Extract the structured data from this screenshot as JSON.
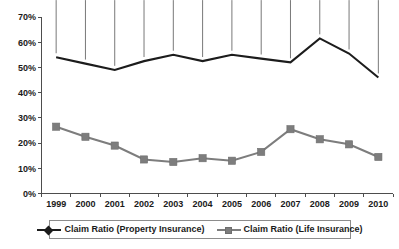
{
  "chart_data": {
    "type": "line",
    "title": "",
    "subtitle": "",
    "xlabel": "",
    "ylabel": "",
    "categories": [
      "1999",
      "2000",
      "2001",
      "2002",
      "2003",
      "2004",
      "2005",
      "2006",
      "2007",
      "2008",
      "2009",
      "2010"
    ],
    "ylim": [
      0,
      70
    ],
    "y_tick_labels": [
      "0%",
      "10%",
      "20%",
      "30%",
      "40%",
      "50%",
      "60%",
      "70%"
    ],
    "y_tick_values": [
      0,
      10,
      20,
      30,
      40,
      50,
      60,
      70
    ],
    "grid": false,
    "legend_position": "bottom",
    "series": [
      {
        "name": "Claim Ratio (Property Insurance)",
        "color": "#1c1c1c",
        "marker": "diamond",
        "values": [
          54,
          51.5,
          49,
          52.5,
          55,
          52.5,
          55,
          53.5,
          52,
          61.5,
          55.5,
          46
        ]
      },
      {
        "name": "Claim Ratio (Life Insurance)",
        "color": "#7d7d7d",
        "marker": "square",
        "values": [
          26.5,
          22.5,
          19,
          13.5,
          12.5,
          14,
          13,
          16.5,
          25.5,
          21.5,
          19.5,
          14.5
        ]
      }
    ]
  },
  "legend": {
    "entries": [
      {
        "label": "Claim Ratio (Property Insurance)"
      },
      {
        "label": "Claim Ratio (Life Insurance)"
      }
    ]
  }
}
